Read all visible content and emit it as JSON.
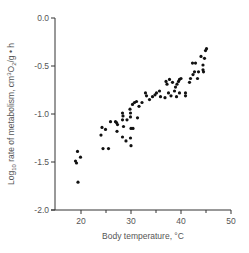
{
  "chart_data": {
    "type": "scatter",
    "title": "",
    "xlabel": "Body temperature, °C",
    "ylabel": "Log10 rate of metabolism, cm3O2/g • h",
    "ylabel_parts": {
      "prefix": "Log",
      "subscript": "10",
      "middle": " rate of metabolism, cm",
      "superscript": "3",
      "o": "O",
      "o_sub": "2",
      "suffix": "/g • h"
    },
    "xlim": [
      15,
      50
    ],
    "ylim": [
      -2.0,
      0.0
    ],
    "xticks": [
      20,
      30,
      40,
      50
    ],
    "xticks_minor": [
      25,
      35,
      45
    ],
    "xtick_labels": [
      "20",
      "30",
      "40",
      "50"
    ],
    "yticks": [
      0.0,
      -0.5,
      -1.0,
      -1.5,
      -2.0
    ],
    "ytick_labels": [
      "0.0",
      "-0.5",
      "-1.0",
      "-1.5",
      "-2.0"
    ],
    "grid": false,
    "legend": null,
    "points": [
      [
        19.3,
        -1.39
      ],
      [
        18.9,
        -1.49
      ],
      [
        19.1,
        -1.51
      ],
      [
        19.9,
        -1.45
      ],
      [
        19.4,
        -1.71
      ],
      [
        24.0,
        -1.22
      ],
      [
        24.2,
        -1.14
      ],
      [
        24.9,
        -1.16
      ],
      [
        24.4,
        -1.36
      ],
      [
        25.5,
        -1.36
      ],
      [
        25.9,
        -1.08
      ],
      [
        26.9,
        -1.08
      ],
      [
        27.1,
        -1.09
      ],
      [
        27.3,
        -1.11
      ],
      [
        27.2,
        -1.18
      ],
      [
        28.3,
        -0.99
      ],
      [
        28.4,
        -1.02
      ],
      [
        28.3,
        -1.06
      ],
      [
        28.5,
        -1.13
      ],
      [
        28.3,
        -1.24
      ],
      [
        29.0,
        -1.28
      ],
      [
        29.2,
        -1.06
      ],
      [
        29.8,
        -0.95
      ],
      [
        29.9,
        -0.99
      ],
      [
        29.9,
        -1.03
      ],
      [
        30.0,
        -1.15
      ],
      [
        30.4,
        -1.15
      ],
      [
        29.9,
        -1.25
      ],
      [
        30.0,
        -1.33
      ],
      [
        30.3,
        -0.9
      ],
      [
        30.7,
        -0.88
      ],
      [
        31.1,
        -0.87
      ],
      [
        31.3,
        -1.04
      ],
      [
        31.6,
        -0.92
      ],
      [
        32.2,
        -0.88
      ],
      [
        32.9,
        -0.78
      ],
      [
        33.1,
        -0.81
      ],
      [
        33.7,
        -0.85
      ],
      [
        34.3,
        -0.82
      ],
      [
        34.8,
        -0.8
      ],
      [
        35.1,
        -0.78
      ],
      [
        35.7,
        -0.76
      ],
      [
        35.9,
        -0.82
      ],
      [
        36.8,
        -0.83
      ],
      [
        37.0,
        -0.66
      ],
      [
        37.2,
        -0.69
      ],
      [
        37.7,
        -0.64
      ],
      [
        37.5,
        -0.78
      ],
      [
        38.0,
        -0.81
      ],
      [
        38.3,
        -0.67
      ],
      [
        38.7,
        -0.76
      ],
      [
        38.9,
        -0.72
      ],
      [
        39.2,
        -0.69
      ],
      [
        39.5,
        -0.66
      ],
      [
        39.7,
        -0.64
      ],
      [
        40.0,
        -0.63
      ],
      [
        39.1,
        -0.82
      ],
      [
        39.7,
        -0.78
      ],
      [
        40.9,
        -0.78
      ],
      [
        40.9,
        -0.81
      ],
      [
        41.7,
        -0.67
      ],
      [
        41.9,
        -0.63
      ],
      [
        42.4,
        -0.59
      ],
      [
        42.7,
        -0.56
      ],
      [
        42.3,
        -0.47
      ],
      [
        42.9,
        -0.47
      ],
      [
        43.3,
        -0.63
      ],
      [
        43.5,
        -0.56
      ],
      [
        44.0,
        -0.4
      ],
      [
        44.4,
        -0.49
      ],
      [
        44.4,
        -0.54
      ],
      [
        44.5,
        -0.56
      ],
      [
        44.7,
        -0.42
      ],
      [
        44.9,
        -0.34
      ],
      [
        45.1,
        -0.32
      ]
    ],
    "marker_color": "#111111",
    "axis_color": "#333333",
    "text_color": "#555555"
  },
  "layout": {
    "plot_left": 55,
    "plot_top": 18,
    "plot_bottom": 210,
    "x_px_at_20": 81,
    "px_per_x_unit": 5,
    "px_per_y_unit": 96
  }
}
